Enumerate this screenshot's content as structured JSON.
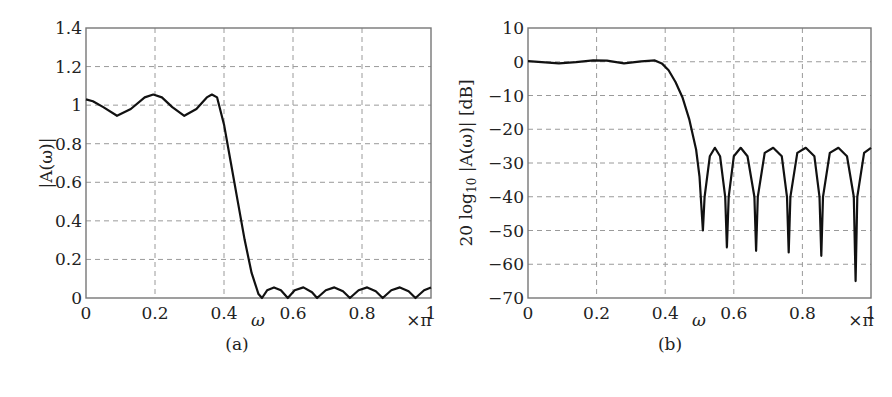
{
  "chart_data": [
    {
      "type": "line",
      "panel_label": "(a)",
      "title": "",
      "xlabel": "ω",
      "x_unit": "×π",
      "ylabel": "|A(ω)|",
      "xlim": [
        0,
        1
      ],
      "ylim": [
        0,
        1.4
      ],
      "xticks": [
        "0",
        "0.2",
        "0.4",
        "0.6",
        "0.8",
        "1"
      ],
      "yticks": [
        "0",
        "0.2",
        "0.4",
        "0.6",
        "0.8",
        "1",
        "1.2",
        "1.4"
      ],
      "grid": true,
      "series": [
        {
          "name": "|A(ω)|",
          "x": [
            0,
            0.02,
            0.05,
            0.09,
            0.13,
            0.17,
            0.195,
            0.22,
            0.25,
            0.285,
            0.32,
            0.35,
            0.365,
            0.38,
            0.4,
            0.42,
            0.44,
            0.46,
            0.48,
            0.5,
            0.51,
            0.525,
            0.545,
            0.565,
            0.585,
            0.605,
            0.63,
            0.655,
            0.67,
            0.695,
            0.72,
            0.745,
            0.765,
            0.79,
            0.815,
            0.84,
            0.86,
            0.885,
            0.91,
            0.935,
            0.955,
            0.98,
            1.0
          ],
          "values": [
            1.03,
            1.02,
            0.99,
            0.945,
            0.98,
            1.04,
            1.055,
            1.04,
            0.99,
            0.945,
            0.98,
            1.04,
            1.055,
            1.04,
            0.9,
            0.7,
            0.5,
            0.3,
            0.13,
            0.02,
            0.0,
            0.04,
            0.055,
            0.04,
            0.0,
            0.04,
            0.055,
            0.03,
            0.0,
            0.04,
            0.055,
            0.035,
            0.0,
            0.04,
            0.055,
            0.035,
            0.0,
            0.04,
            0.055,
            0.035,
            0.0,
            0.04,
            0.055
          ]
        }
      ]
    },
    {
      "type": "line",
      "panel_label": "(b)",
      "title": "",
      "xlabel": "ω",
      "x_unit": "×π",
      "ylabel": "20 log10 |A(ω)| [dB]",
      "xlim": [
        0,
        1
      ],
      "ylim": [
        -70,
        10
      ],
      "xticks": [
        "0",
        "0.2",
        "0.4",
        "0.6",
        "0.8",
        "1"
      ],
      "yticks": [
        "−70",
        "−60",
        "−50",
        "−40",
        "−30",
        "−20",
        "−10",
        "0",
        "10"
      ],
      "grid": true,
      "series": [
        {
          "name": "20log10|A(ω)|",
          "x": [
            0,
            0.05,
            0.09,
            0.14,
            0.19,
            0.23,
            0.28,
            0.33,
            0.37,
            0.39,
            0.41,
            0.43,
            0.45,
            0.47,
            0.49,
            0.5,
            0.51,
            0.515,
            0.53,
            0.545,
            0.56,
            0.575,
            0.58,
            0.585,
            0.6,
            0.62,
            0.64,
            0.66,
            0.665,
            0.67,
            0.69,
            0.715,
            0.74,
            0.755,
            0.76,
            0.765,
            0.785,
            0.81,
            0.835,
            0.85,
            0.855,
            0.86,
            0.88,
            0.905,
            0.93,
            0.95,
            0.955,
            0.96,
            0.98,
            1.0
          ],
          "values": [
            0.2,
            -0.2,
            -0.5,
            -0.1,
            0.4,
            0.3,
            -0.5,
            0.1,
            0.4,
            -0.5,
            -2.5,
            -6,
            -10.5,
            -17,
            -26,
            -34,
            -50,
            -40,
            -28,
            -25.5,
            -28,
            -40,
            -55,
            -40,
            -28,
            -25.5,
            -28,
            -40,
            -56,
            -40,
            -27,
            -25.5,
            -28,
            -40,
            -56.5,
            -40,
            -27,
            -25.5,
            -28,
            -40,
            -57.5,
            -40,
            -27,
            -25.5,
            -28,
            -40,
            -65,
            -40,
            -27,
            -25.5
          ]
        }
      ]
    }
  ],
  "panels": {
    "a": {
      "label": "(a)",
      "xlabel": "ω",
      "xunit": "×π",
      "ylabel": "|A(ω)|"
    },
    "b": {
      "label": "(b)",
      "xlabel": "ω",
      "xunit": "×π",
      "ylabel_main": "20 log",
      "ylabel_sub": "10",
      "ylabel_rest": " |A(ω)|  [dB]"
    }
  },
  "style": {
    "curve_color": "#111111",
    "grid_color": "#9a9a9a",
    "frame_color": "#777777"
  }
}
